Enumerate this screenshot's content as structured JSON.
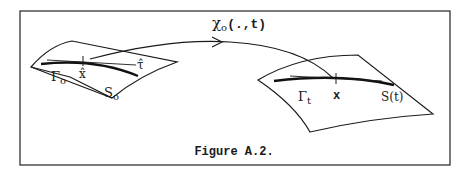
{
  "figure": {
    "caption": "Figure A.2.",
    "map_label_symbol": "χ",
    "map_label_sub": "o",
    "map_label_args": "(.,t)",
    "left_surface": {
      "curve_label": "Γ",
      "curve_label_sub": "o",
      "point_label": "x̂",
      "tangent_label": "τ̂",
      "surface_label": "S",
      "surface_label_sub": "o"
    },
    "right_surface": {
      "curve_label": "Γ",
      "curve_label_sub": "t",
      "point_label": "x",
      "surface_label": "S(t)"
    },
    "colors": {
      "ink": "#1a1a1a",
      "background": "#ffffff"
    }
  }
}
